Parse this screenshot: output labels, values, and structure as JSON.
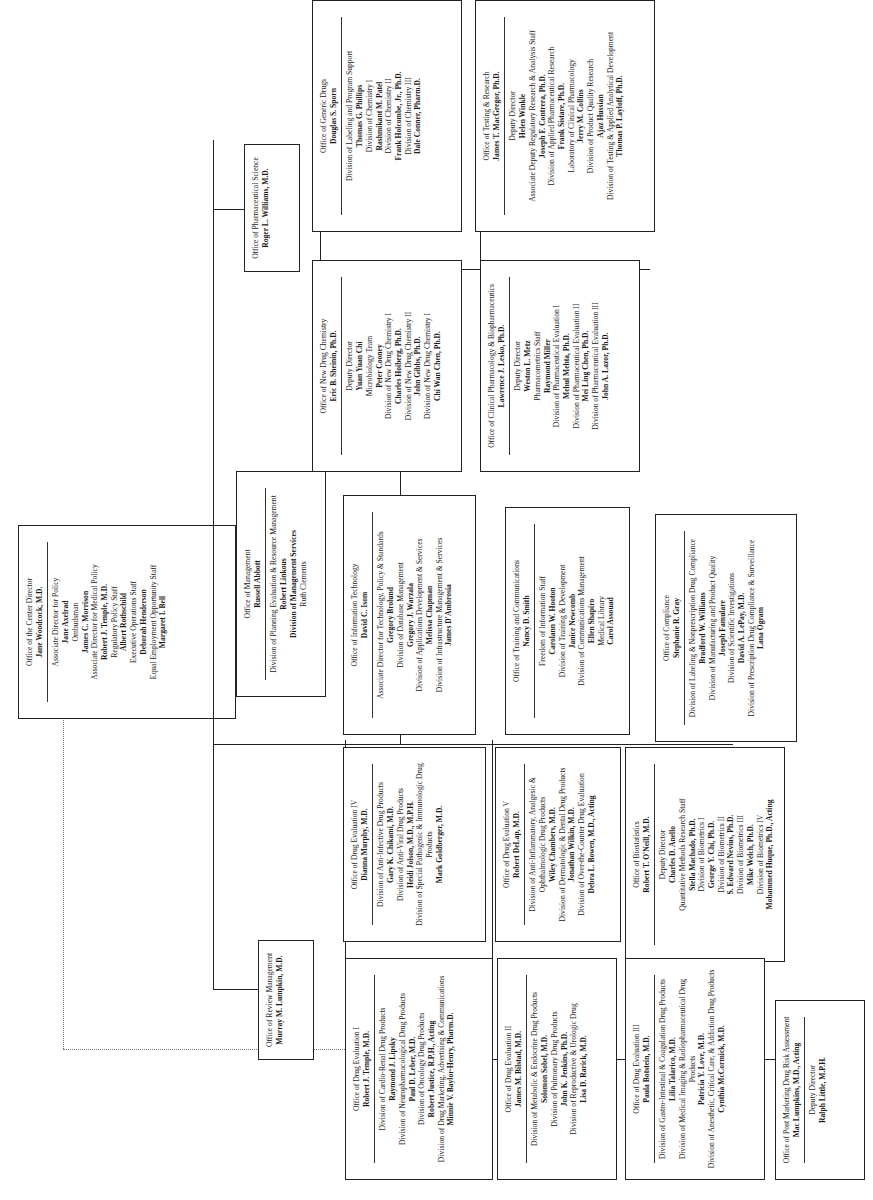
{
  "center_director": {
    "office": "Office of the Center Director",
    "head": "Jane Woodcock, M.D.",
    "lines": [
      {
        "t": "Associate Director for Policy",
        "b": false
      },
      {
        "t": "Jane Axelrad",
        "b": true
      },
      {
        "t": "Ombudsman",
        "b": false
      },
      {
        "t": "James C. Morrison",
        "b": true
      },
      {
        "t": "Associate Director for Medical Policy",
        "b": false
      },
      {
        "t": "Robert J. Temple, M.D.",
        "b": true
      },
      {
        "t": "Regulatory Policy Staff",
        "b": false
      },
      {
        "t": "Albert Rothschild",
        "b": true
      },
      {
        "t": "Executive Operations Staff",
        "b": false
      },
      {
        "t": "Deborah Henderson",
        "b": true
      },
      {
        "t": "Equal Employment Opportunity Staff",
        "b": false
      },
      {
        "t": "Margaret I. Bell",
        "b": true
      }
    ]
  },
  "pharmaceutical_science": {
    "office": "Office of Pharmaceutical Science",
    "head": "Roger L. Williams, M.D.",
    "children": [
      {
        "office": "Office of Generic Drugs",
        "head": "Douglas S. Sporn",
        "lines": [
          {
            "t": "Division of Labeling and Program Support",
            "b": false
          },
          {
            "t": "Thomas G. Phillips",
            "b": true
          },
          {
            "t": "Division of Chemistry I",
            "b": false
          },
          {
            "t": "Rashmikant M. Patel",
            "b": true
          },
          {
            "t": "Division of Chemistry II",
            "b": false
          },
          {
            "t": "Frank Holcombe, Jr., Ph.D.",
            "b": true
          },
          {
            "t": "Division of Chemistry III",
            "b": false
          },
          {
            "t": "Dale Conner, Pharm.D.",
            "b": true
          }
        ]
      },
      {
        "office": "Office of Testing & Research",
        "head": "James T. MacGregor, Ph.D.",
        "lines": [
          {
            "t": "Deputy Director",
            "b": false
          },
          {
            "t": "Helen Winkle",
            "b": true
          },
          {
            "t": "Associate Deputy Regulatory Research & Analysis Staff",
            "b": false
          },
          {
            "t": "Joseph F. Contrera, Ph.D.",
            "b": true
          },
          {
            "t": "Division of Applied Pharmaceutical Research",
            "b": false
          },
          {
            "t": "Frank Sistare, Ph.D.",
            "b": true
          },
          {
            "t": "Laboratory of Clinical Pharmacology",
            "b": false
          },
          {
            "t": "Jerry M. Collins",
            "b": true
          },
          {
            "t": "Division of Product Quality Research",
            "b": false
          },
          {
            "t": "Ajaz Hussian",
            "b": true
          },
          {
            "t": "Division of Testing & Applied Analytical Development",
            "b": false
          },
          {
            "t": "Thomas P. Layloff, Ph.D.",
            "b": true
          }
        ]
      },
      {
        "office": "Office of New Drug Chemistry",
        "head": "Eric B. Sheinin, Ph.D.",
        "lines": [
          {
            "t": "Deputy Director",
            "b": false
          },
          {
            "t": "Yuan Yuan Chi",
            "b": true
          },
          {
            "t": "Microbiology Team",
            "b": false
          },
          {
            "t": "Peter Cooney",
            "b": true
          },
          {
            "t": "Division of New Drug Chemistry I",
            "b": false
          },
          {
            "t": "Charles Hoiberg, Ph.D.",
            "b": true
          },
          {
            "t": "Division of New Drug Chemistry II",
            "b": false
          },
          {
            "t": "John Gibbs, Ph.D.",
            "b": true
          },
          {
            "t": "Division of New Drug Chemistry I",
            "b": false
          },
          {
            "t": "Chi Wan Chen, Ph.D.",
            "b": true
          }
        ]
      },
      {
        "office": "Office of Clinical Pharmacology & Biopharmaceutics",
        "head": "Lawrence J. Lesko, Ph.D.",
        "lines": [
          {
            "t": "Deputy Director",
            "b": false
          },
          {
            "t": "Weston L. Metz",
            "b": true
          },
          {
            "t": "Pharmacometrics Staff",
            "b": false
          },
          {
            "t": "Raymond Miller",
            "b": true
          },
          {
            "t": "Division of Pharmaceutical Evaluation I",
            "b": false
          },
          {
            "t": "Mehul Mehta, Ph.D.",
            "b": true
          },
          {
            "t": "Division of Pharmaceutical Evaluation II",
            "b": false
          },
          {
            "t": "Mei Ling Chen, Ph.D.",
            "b": true
          },
          {
            "t": "Division of Pharmaceutical Evaluation III",
            "b": false
          },
          {
            "t": "John A. Lazor, Ph.D.",
            "b": true
          }
        ]
      }
    ]
  },
  "support_offices": [
    {
      "office": "Office of Management",
      "head": "Russell Abbott",
      "lines": [
        {
          "t": "Division of Planning Evaluation & Resource Management",
          "b": false
        },
        {
          "t": "Robert Linkous",
          "b": true
        },
        {
          "t": "Division of Management Services",
          "b": true
        },
        {
          "t": "Ruth Clements",
          "b": false
        }
      ]
    },
    {
      "office": "Office of Information Technology",
      "head": "David C. Isom",
      "lines": [
        {
          "t": "Associate Director for Technology, Policy & Standards",
          "b": false
        },
        {
          "t": "Gregory Brolund",
          "b": true
        },
        {
          "t": "Division of Database Management",
          "b": false
        },
        {
          "t": "Gregory J. Warzala",
          "b": true
        },
        {
          "t": "Division of Applications Development & Services",
          "b": false
        },
        {
          "t": "Melissa Chapman",
          "b": true
        },
        {
          "t": "Division of Infrastructure Management & Services",
          "b": false
        },
        {
          "t": "James D'Ambrosia",
          "b": true
        }
      ]
    },
    {
      "office": "Office of Training and Communications",
      "head": "Nancy D. Smith",
      "lines": [
        {
          "t": "Freedom of Information Staff",
          "b": false
        },
        {
          "t": "Carolann W. Hooton",
          "b": true
        },
        {
          "t": "Division of Training & Development",
          "b": false
        },
        {
          "t": "Janice Newcomb",
          "b": true
        },
        {
          "t": "Division of Communications Management",
          "b": false
        },
        {
          "t": "Ellen Shapiro",
          "b": true
        },
        {
          "t": "Medical Library",
          "b": false
        },
        {
          "t": "Carol Assouad",
          "b": true
        }
      ]
    },
    {
      "office": "Office of Compliance",
      "head": "Stephanie R. Gray",
      "lines": [
        {
          "t": "Division of Labeling & Nonprescription Drug Compliance",
          "b": false
        },
        {
          "t": "Bradford W. Williams",
          "b": true
        },
        {
          "t": "Division of Manufacturing and Product Quality",
          "b": false
        },
        {
          "t": "Joseph Famulare",
          "b": true
        },
        {
          "t": "Division of Scientific Investigations",
          "b": false
        },
        {
          "t": "David A. LePay, M.D.",
          "b": true
        },
        {
          "t": "Division of Prescription Drug Compliance & Surveillance",
          "b": false
        },
        {
          "t": "Lana Ogram",
          "b": true
        }
      ]
    }
  ],
  "review_management": {
    "office": "Office of Review Management",
    "head": "Murray M. Lumpkin, M.D.",
    "upper": [
      {
        "office": "Office of Drug Evaluation IV",
        "head": "Dianna Murphy, M.D.",
        "lines": [
          {
            "t": "Division of Anti-Infective Drug Products",
            "b": false
          },
          {
            "t": "Gary K. Chikami, M.D.",
            "b": true
          },
          {
            "t": "Division of Anti-Viral Drug Products",
            "b": false
          },
          {
            "t": "Heidi Jolson, M.D., M.P.H.",
            "b": true
          },
          {
            "t": "Division of Special Pathogenic & Immunologic Drug Products",
            "b": false
          },
          {
            "t": "Mark Goldberger, M.D.",
            "b": true
          }
        ]
      },
      {
        "office": "Office of Drug Evaluation V",
        "head": "Robert DeLap, M.D.",
        "lines": [
          {
            "t": "Division of Anti-Inflammatory, Analgesic & Ophthalmologic Drug Products",
            "b": false
          },
          {
            "t": "Wiley Chambers, M.D.",
            "b": true
          },
          {
            "t": "Division of Dermatologic & Dental Drug Products",
            "b": false
          },
          {
            "t": "Jonathan Wilkin, M.D.",
            "b": true
          },
          {
            "t": "Division of Over-the-Counter Drug Evaluation",
            "b": false
          },
          {
            "t": "Debra L. Bowen, M.D., Acting",
            "b": true
          }
        ]
      },
      {
        "office": "Office of Biostatistics",
        "head": "Robert T. O'Neill, M.D.",
        "lines": [
          {
            "t": "Deputy Director",
            "b": false
          },
          {
            "t": "Charles D. Anello",
            "b": true
          },
          {
            "t": "Quantitative Methods Research Staff",
            "b": false
          },
          {
            "t": "Stella Machado, Ph.D.",
            "b": true
          },
          {
            "t": "Division of Biometrics I",
            "b": false
          },
          {
            "t": "George Y. Chi, Ph.D.",
            "b": true
          },
          {
            "t": "Division of Biometrics II",
            "b": false
          },
          {
            "t": "S. Edward Nevius, Ph.D.",
            "b": true
          },
          {
            "t": "Division of Biometrics III",
            "b": false
          },
          {
            "t": "Mike Welch, Ph.D.",
            "b": true
          },
          {
            "t": "Division of Biometrics IV",
            "b": false
          },
          {
            "t": "Mohammed Huque, Ph.D., Acting",
            "b": true
          }
        ]
      }
    ],
    "lower": [
      {
        "office": "Office of Drug Evaluation I",
        "head": "Robert J. Temple, M.D.",
        "lines": [
          {
            "t": "Division of Cardio-Renal Drug Products",
            "b": false
          },
          {
            "t": "Raymond J. Lipsky",
            "b": true
          },
          {
            "t": "Division of Neuropharmacological Drug Products",
            "b": false
          },
          {
            "t": "Paul D. Leber, M.D.",
            "b": true
          },
          {
            "t": "Division of Oncology Drug Products",
            "b": false
          },
          {
            "t": "Robert Justice, R.P.H., Acting",
            "b": true
          },
          {
            "t": "Division of Drug Marketing, Advertising & Communications",
            "b": false
          },
          {
            "t": "Minnie V. Baylor-Henry, Pharm.D.",
            "b": true
          }
        ]
      },
      {
        "office": "Office of Drug Evaluation II",
        "head": "James M. Bilstad, M.D.",
        "lines": [
          {
            "t": "Division of Metabolic & Endocrine Drug Products",
            "b": false
          },
          {
            "t": "Solomon Sobel, M.D.",
            "b": true
          },
          {
            "t": "Division of Pulmonary Drug Products",
            "b": false
          },
          {
            "t": "John K. Jenkins, Ph.D.",
            "b": true
          },
          {
            "t": "Division of Reproductive & Urologic Drug",
            "b": false
          },
          {
            "t": "Lisa D. Rarick, M.D.",
            "b": true
          }
        ]
      },
      {
        "office": "Office of Drug Evaluation III",
        "head": "Paula Botstein, M.D.",
        "lines": [
          {
            "t": "Division of Gastro-Intestinal & Coagulation Drug Products",
            "b": false
          },
          {
            "t": "Lilia Talarico, M.D.",
            "b": true
          },
          {
            "t": "Division of Medical Imaging & Radiopharmaceutical Drug Products",
            "b": false
          },
          {
            "t": "Patricia Y. Love, M.D.",
            "b": true
          },
          {
            "t": "Division of Anesthetic, Critical Care, & Addiction Drug Products",
            "b": false
          },
          {
            "t": "Cynthia McCormick, M.D.",
            "b": true
          }
        ]
      },
      {
        "office": "Office of Post Marketing Drug Risk Assessment",
        "head": "Mac Lumpkins, M.D., Acting",
        "lines": [
          {
            "t": "Deputy Director",
            "b": false
          },
          {
            "t": "Ralph Little, M.P.H.",
            "b": true
          }
        ]
      }
    ]
  }
}
